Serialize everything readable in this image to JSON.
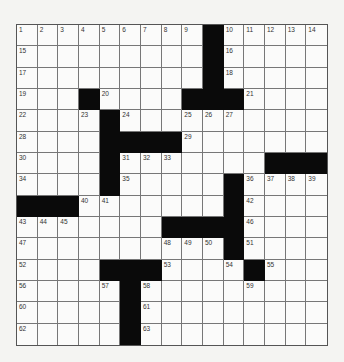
{
  "puzzle": {
    "rows": 15,
    "cols": 15,
    "blocks": [
      [
        0,
        9
      ],
      [
        1,
        9
      ],
      [
        2,
        9
      ],
      [
        3,
        3
      ],
      [
        3,
        8
      ],
      [
        3,
        9
      ],
      [
        3,
        10
      ],
      [
        4,
        4
      ],
      [
        5,
        4
      ],
      [
        5,
        5
      ],
      [
        5,
        6
      ],
      [
        5,
        7
      ],
      [
        6,
        4
      ],
      [
        6,
        12
      ],
      [
        6,
        13
      ],
      [
        6,
        14
      ],
      [
        7,
        4
      ],
      [
        7,
        10
      ],
      [
        8,
        0
      ],
      [
        8,
        1
      ],
      [
        8,
        2
      ],
      [
        8,
        10
      ],
      [
        9,
        7
      ],
      [
        9,
        8
      ],
      [
        9,
        9
      ],
      [
        9,
        10
      ],
      [
        10,
        10
      ],
      [
        11,
        4
      ],
      [
        11,
        5
      ],
      [
        11,
        6
      ],
      [
        11,
        11
      ],
      [
        12,
        5
      ],
      [
        13,
        5
      ],
      [
        14,
        5
      ]
    ],
    "numbers": [
      {
        "r": 0,
        "c": 0,
        "n": "1"
      },
      {
        "r": 0,
        "c": 1,
        "n": "2"
      },
      {
        "r": 0,
        "c": 2,
        "n": "3"
      },
      {
        "r": 0,
        "c": 3,
        "n": "4"
      },
      {
        "r": 0,
        "c": 4,
        "n": "5"
      },
      {
        "r": 0,
        "c": 5,
        "n": "6"
      },
      {
        "r": 0,
        "c": 6,
        "n": "7"
      },
      {
        "r": 0,
        "c": 7,
        "n": "8"
      },
      {
        "r": 0,
        "c": 8,
        "n": "9"
      },
      {
        "r": 0,
        "c": 10,
        "n": "10"
      },
      {
        "r": 0,
        "c": 11,
        "n": "11"
      },
      {
        "r": 0,
        "c": 12,
        "n": "12"
      },
      {
        "r": 0,
        "c": 13,
        "n": "13"
      },
      {
        "r": 0,
        "c": 14,
        "n": "14"
      },
      {
        "r": 1,
        "c": 0,
        "n": "15"
      },
      {
        "r": 1,
        "c": 10,
        "n": "16"
      },
      {
        "r": 2,
        "c": 0,
        "n": "17"
      },
      {
        "r": 2,
        "c": 10,
        "n": "18"
      },
      {
        "r": 3,
        "c": 0,
        "n": "19"
      },
      {
        "r": 3,
        "c": 4,
        "n": "20"
      },
      {
        "r": 3,
        "c": 11,
        "n": "21"
      },
      {
        "r": 4,
        "c": 0,
        "n": "22"
      },
      {
        "r": 4,
        "c": 3,
        "n": "23"
      },
      {
        "r": 4,
        "c": 5,
        "n": "24"
      },
      {
        "r": 4,
        "c": 8,
        "n": "25"
      },
      {
        "r": 4,
        "c": 9,
        "n": "26"
      },
      {
        "r": 4,
        "c": 10,
        "n": "27"
      },
      {
        "r": 5,
        "c": 0,
        "n": "28"
      },
      {
        "r": 5,
        "c": 8,
        "n": "29"
      },
      {
        "r": 6,
        "c": 0,
        "n": "30"
      },
      {
        "r": 6,
        "c": 5,
        "n": "31"
      },
      {
        "r": 6,
        "c": 6,
        "n": "32"
      },
      {
        "r": 6,
        "c": 7,
        "n": "33"
      },
      {
        "r": 7,
        "c": 0,
        "n": "34"
      },
      {
        "r": 7,
        "c": 5,
        "n": "35"
      },
      {
        "r": 7,
        "c": 11,
        "n": "36"
      },
      {
        "r": 7,
        "c": 12,
        "n": "37"
      },
      {
        "r": 7,
        "c": 13,
        "n": "38"
      },
      {
        "r": 7,
        "c": 14,
        "n": "39"
      },
      {
        "r": 8,
        "c": 3,
        "n": "40"
      },
      {
        "r": 8,
        "c": 4,
        "n": "41"
      },
      {
        "r": 8,
        "c": 11,
        "n": "42"
      },
      {
        "r": 9,
        "c": 0,
        "n": "43"
      },
      {
        "r": 9,
        "c": 1,
        "n": "44"
      },
      {
        "r": 9,
        "c": 2,
        "n": "45"
      },
      {
        "r": 9,
        "c": 11,
        "n": "46"
      },
      {
        "r": 10,
        "c": 0,
        "n": "47"
      },
      {
        "r": 10,
        "c": 7,
        "n": "48"
      },
      {
        "r": 10,
        "c": 8,
        "n": "49"
      },
      {
        "r": 10,
        "c": 9,
        "n": "50"
      },
      {
        "r": 10,
        "c": 11,
        "n": "51"
      },
      {
        "r": 11,
        "c": 0,
        "n": "52"
      },
      {
        "r": 11,
        "c": 7,
        "n": "53"
      },
      {
        "r": 11,
        "c": 10,
        "n": "54"
      },
      {
        "r": 11,
        "c": 12,
        "n": "55"
      },
      {
        "r": 12,
        "c": 0,
        "n": "56"
      },
      {
        "r": 12,
        "c": 4,
        "n": "57"
      },
      {
        "r": 12,
        "c": 6,
        "n": "58"
      },
      {
        "r": 12,
        "c": 11,
        "n": "59"
      },
      {
        "r": 13,
        "c": 0,
        "n": "60"
      },
      {
        "r": 13,
        "c": 6,
        "n": "61"
      },
      {
        "r": 14,
        "c": 0,
        "n": "62"
      },
      {
        "r": 14,
        "c": 6,
        "n": "63"
      }
    ],
    "colors": {
      "block": "#0a0a0a",
      "cell": "#fbfbfa",
      "line": "#777777",
      "number": "#333333"
    }
  }
}
